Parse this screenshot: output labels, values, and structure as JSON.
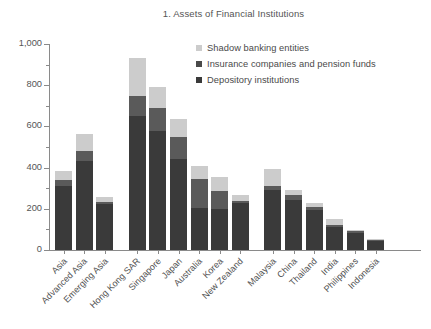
{
  "chart_data": {
    "type": "bar",
    "subtype": "stacked-bar",
    "title": "1. Assets of Financial Institutions",
    "xlabel": "",
    "ylabel": "",
    "ylim": [
      0,
      1000
    ],
    "yticks": [
      0,
      200,
      400,
      600,
      800,
      1000
    ],
    "ytick_labels": [
      "0",
      "200",
      "400",
      "600",
      "800",
      "1,000"
    ],
    "yticks_minor": [
      100,
      300,
      500,
      700,
      900
    ],
    "grid": false,
    "legend_position": "top-right",
    "categories": [
      "Asia",
      "Advanced Asia",
      "Emerging Asia",
      "Hong Kong SAR",
      "Singapore",
      "Japan",
      "Australia",
      "Korea",
      "New Zealand",
      "Malaysia",
      "China",
      "Thailand",
      "India",
      "Philippines",
      "Indonesia"
    ],
    "group_breaks": [
      3,
      9
    ],
    "series": [
      {
        "name": "Depository institutions",
        "color": "#3a3a3a",
        "values": [
          310,
          430,
          225,
          650,
          580,
          440,
          205,
          200,
          230,
          290,
          245,
          195,
          110,
          85,
          48
        ]
      },
      {
        "name": "Insurance companies and pension funds",
        "color": "#5a5a5a",
        "values": [
          30,
          50,
          8,
          100,
          110,
          110,
          140,
          85,
          10,
          20,
          20,
          12,
          10,
          6,
          3
        ]
      },
      {
        "name": "Shadow banking entities",
        "color": "#cccccc",
        "values": [
          45,
          85,
          22,
          180,
          100,
          85,
          65,
          70,
          25,
          85,
          25,
          22,
          30,
          6,
          3
        ]
      }
    ],
    "totals": [
      385,
      565,
      255,
      930,
      790,
      635,
      410,
      355,
      265,
      395,
      290,
      229,
      150,
      97,
      54
    ]
  },
  "legend": {
    "items": [
      {
        "label": "Shadow banking entities",
        "color": "#cccccc"
      },
      {
        "label": "Insurance companies and pension funds",
        "color": "#4a4a4a"
      },
      {
        "label": "Depository institutions",
        "color": "#3a3a3a"
      }
    ]
  },
  "colors": {
    "axis": "#8a8a8a",
    "text": "#4f4f4f",
    "background": "#ffffff"
  }
}
